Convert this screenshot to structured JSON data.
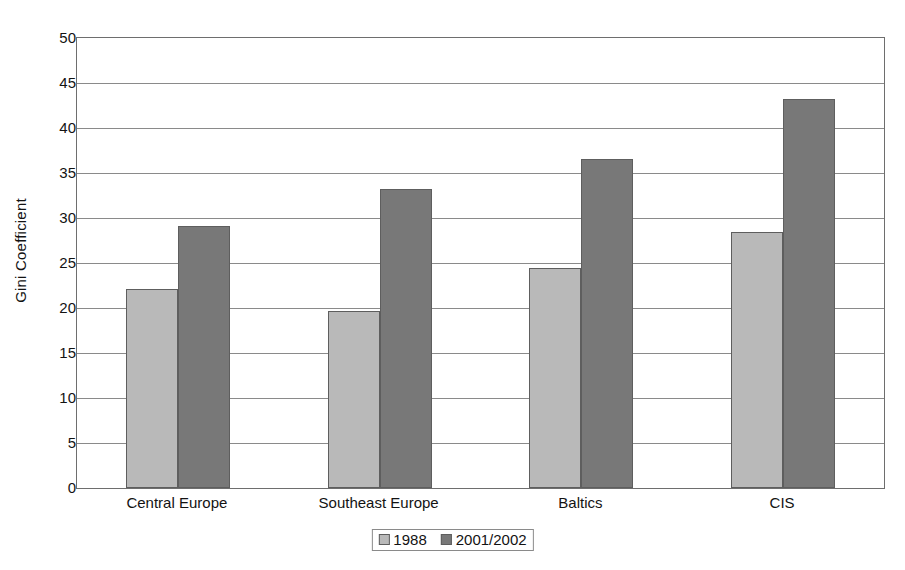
{
  "chart_data": {
    "type": "bar",
    "title": "",
    "subtitle": "",
    "xlabel": "",
    "ylabel": "Gini Coefficient",
    "categories": [
      "Central Europe",
      "Southeast Europe",
      "Baltics",
      "CIS"
    ],
    "series": [
      {
        "name": "1988",
        "color": "#b9b9b9",
        "values": [
          22.1,
          19.7,
          24.4,
          28.4
        ]
      },
      {
        "name": "2001/2002",
        "color": "#787878",
        "values": [
          29.1,
          33.2,
          36.6,
          43.2
        ]
      }
    ],
    "ylim": [
      0,
      50
    ],
    "ytick_step": 5,
    "yticks": [
      0,
      5,
      10,
      15,
      20,
      25,
      30,
      35,
      40,
      45,
      50
    ],
    "ytick_labels": [
      "0",
      "5",
      "10",
      "15",
      "20",
      "25",
      "30",
      "35",
      "40",
      "45",
      "50"
    ],
    "grid": "horizontal",
    "legend_position": "bottom-center",
    "legend_entries": [
      "1988",
      "2001/2002"
    ],
    "annotations": [],
    "plot_border_color": "#6e6e6e",
    "gridline_color": "#8a8a8a",
    "background_color": "#ffffff"
  }
}
